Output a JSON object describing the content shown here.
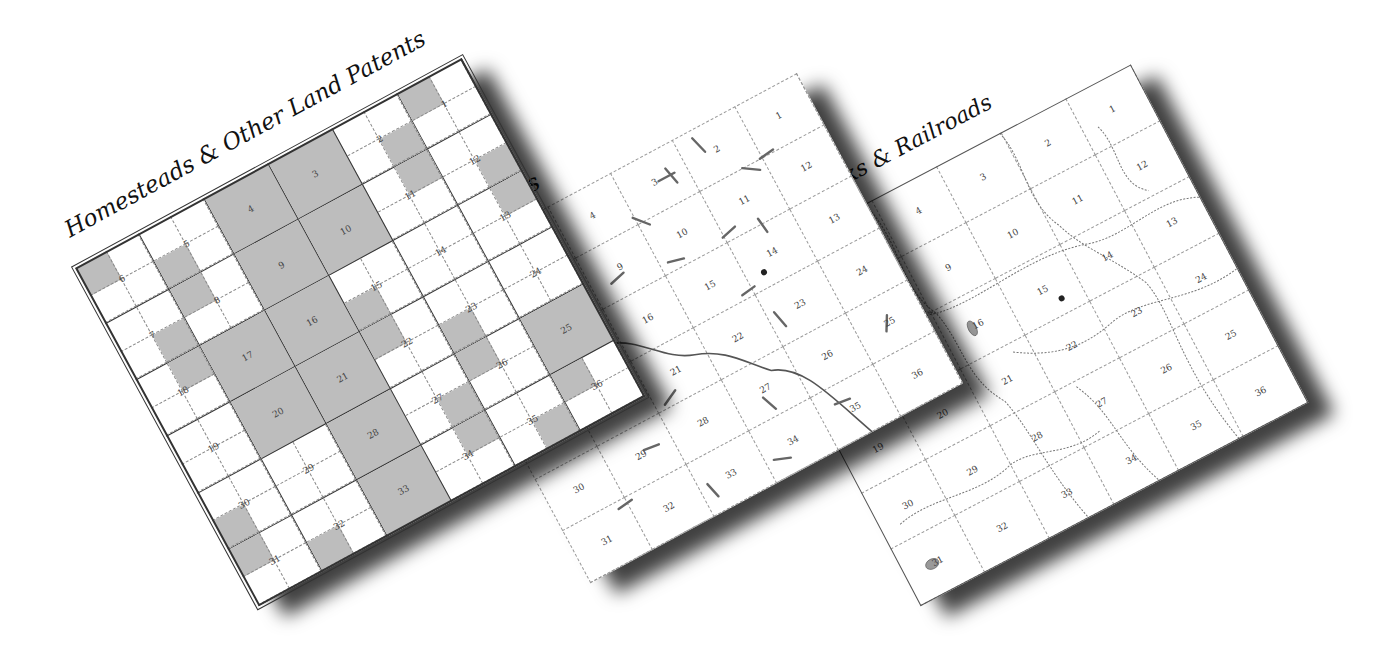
{
  "maps": [
    {
      "title": "Homesteads & Other Land Patents",
      "kind": "land-patents",
      "sections": [
        [
          "6",
          "5",
          "4",
          "3",
          "2",
          "1"
        ],
        [
          "7",
          "8",
          "9",
          "10",
          "11",
          "12"
        ],
        [
          "18",
          "17",
          "16",
          "15",
          "14",
          "13"
        ],
        [
          "19",
          "20",
          "21",
          "22",
          "23",
          "24"
        ],
        [
          "30",
          "29",
          "28",
          "27",
          "26",
          "25"
        ],
        [
          "31",
          "32",
          "33",
          "34",
          "35",
          "36"
        ]
      ],
      "shaded_sections": [
        "4",
        "3",
        "9",
        "10",
        "16",
        "17",
        "21",
        "20",
        "28",
        "33",
        "25"
      ]
    },
    {
      "title": "Roads",
      "kind": "roads",
      "sections": [
        [
          "6",
          "5",
          "4",
          "3",
          "2",
          "1"
        ],
        [
          "7",
          "8",
          "9",
          "10",
          "11",
          "12"
        ],
        [
          "18",
          "17",
          "16",
          "15",
          "14",
          "13"
        ],
        [
          "19",
          "20",
          "21",
          "22",
          "23",
          "24"
        ],
        [
          "30",
          "29",
          "28",
          "27",
          "26",
          "25"
        ],
        [
          "31",
          "32",
          "33",
          "34",
          "35",
          "36"
        ]
      ],
      "place_labels": [
        "Mt. Hill Cem.",
        "Deshayes"
      ]
    },
    {
      "title": "Rivers, Creeks & Railroads",
      "kind": "waterways",
      "sections": [
        [
          "6",
          "5",
          "4",
          "3",
          "2",
          "1"
        ],
        [
          "7",
          "8",
          "9",
          "10",
          "11",
          "12"
        ],
        [
          "18",
          "17",
          "16",
          "15",
          "14",
          "13"
        ],
        [
          "19",
          "20",
          "21",
          "22",
          "23",
          "24"
        ],
        [
          "30",
          "29",
          "28",
          "27",
          "26",
          "25"
        ],
        [
          "31",
          "32",
          "33",
          "34",
          "35",
          "36"
        ]
      ],
      "place_labels": [
        "Bay Creek",
        "Mt. Hill Cem.",
        "Deshayes",
        "Sumpter Creek",
        "Smith Branch",
        "Johnson Creek",
        "Gumwood Canal",
        "Green Branch",
        "Byrd Branch"
      ]
    }
  ]
}
